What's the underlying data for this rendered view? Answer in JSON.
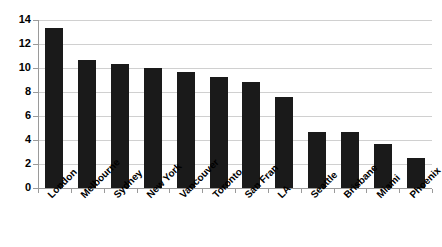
{
  "chart_data": {
    "type": "bar",
    "title": "",
    "subtitle": "",
    "xlabel": "",
    "ylabel": "",
    "categories": [
      "London",
      "Melbourne",
      "Sydney",
      "New York",
      "Vancouver",
      "Toronto",
      "San Fran",
      "LA",
      "Seattle",
      "Brisbane",
      "Miami",
      "Phoenix"
    ],
    "values": [
      13.3,
      10.7,
      10.3,
      10.0,
      9.65,
      9.25,
      8.8,
      7.6,
      4.7,
      4.65,
      3.7,
      2.5
    ],
    "ylim": [
      0,
      14
    ],
    "ytick_labels": [
      "0",
      "2",
      "4",
      "6",
      "8",
      "10",
      "12",
      "14"
    ],
    "ytick_values": [
      0,
      2,
      4,
      6,
      8,
      10,
      12,
      14
    ],
    "grid": true,
    "grid_axis": "y",
    "legend": false,
    "legend_position": "none",
    "bar_color": "#1a1a1a",
    "grid_color": "#d0d0d0",
    "axis_color": "#9a9a9a",
    "background_color": "#ffffff",
    "xtick_label_rotation": -45
  }
}
